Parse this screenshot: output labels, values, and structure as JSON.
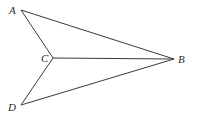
{
  "diagram": {
    "points": {
      "A": {
        "label": "A",
        "x": 21,
        "y": 10,
        "label_x": 9,
        "label_y": 14
      },
      "B": {
        "label": "B",
        "x": 174,
        "y": 59,
        "label_x": 178,
        "label_y": 63
      },
      "C": {
        "label": "C",
        "x": 53,
        "y": 58,
        "label_x": 41,
        "label_y": 62
      },
      "D": {
        "label": "D",
        "x": 21,
        "y": 105,
        "label_x": 8,
        "label_y": 111
      }
    },
    "segments": [
      {
        "from": "A",
        "to": "B"
      },
      {
        "from": "A",
        "to": "C"
      },
      {
        "from": "C",
        "to": "B"
      },
      {
        "from": "C",
        "to": "D"
      },
      {
        "from": "D",
        "to": "B"
      }
    ],
    "colors": {
      "line": "#3a3a3a",
      "text": "#2a2a2a",
      "background": "#ffffff"
    }
  }
}
